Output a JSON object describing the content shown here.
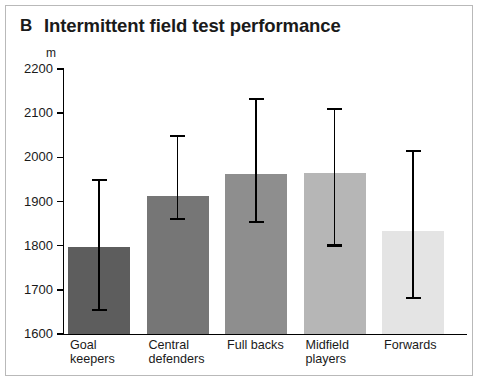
{
  "panel": {
    "letter": "B"
  },
  "chart_data": {
    "type": "bar",
    "title": "Intermittent field test performance",
    "xlabel": "",
    "ylabel": "m",
    "unit": "m",
    "ylim": [
      1600,
      2200
    ],
    "yticks": [
      1600,
      1700,
      1800,
      1900,
      2000,
      2100,
      2200
    ],
    "grid": false,
    "legend": "none",
    "error_bars": "vertical capped range",
    "categories": [
      "Goal keepers",
      "Central defenders",
      "Full backs",
      "Midfield players",
      "Forwards"
    ],
    "category_lines": [
      [
        "Goal",
        "keepers"
      ],
      [
        "Central",
        "defenders"
      ],
      [
        "Full backs"
      ],
      [
        "Midfield",
        "players"
      ],
      [
        "Forwards"
      ]
    ],
    "values": [
      1797,
      1912,
      1962,
      1965,
      1833
    ],
    "error_upper": [
      1948,
      2048,
      2132,
      2109,
      2014
    ],
    "error_lower": [
      1655,
      1860,
      1854,
      1800,
      1682
    ],
    "bar_colors": [
      "#5d5d5d",
      "#767676",
      "#8e8e8e",
      "#b6b6b6",
      "#e4e4e4"
    ]
  },
  "colors": {
    "frame_border": "#b9b9b9",
    "axis": "#000000",
    "background": "#ffffff"
  }
}
